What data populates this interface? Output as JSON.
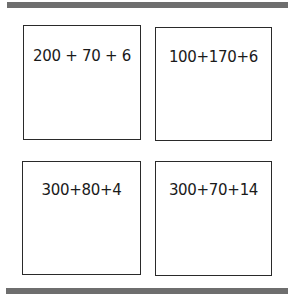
{
  "cards": [
    {
      "expression": "200 + 70 + 6"
    },
    {
      "expression": "100+170+6"
    },
    {
      "expression": "300+80+4"
    },
    {
      "expression": "300+70+14"
    }
  ],
  "colors": {
    "bar": "#6e6e6e",
    "border": "#2a2a2a",
    "background": "#ffffff"
  }
}
